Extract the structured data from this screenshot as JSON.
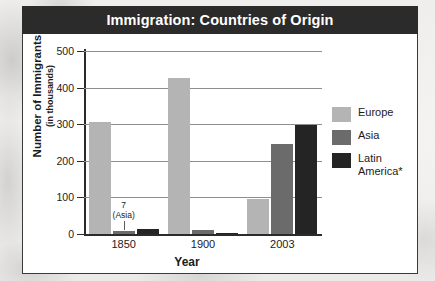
{
  "chart_data": {
    "type": "bar",
    "title": "Immigration: Countries of Origin",
    "xlabel": "Year",
    "ylabel": "Number of Immigrants",
    "ylabel_sub": "(in thousands)",
    "categories": [
      "1850",
      "1900",
      "2003"
    ],
    "ylim": [
      0,
      500
    ],
    "yticks": [
      0,
      100,
      200,
      300,
      400,
      500
    ],
    "ytick_labels": [
      "0",
      "100",
      "200",
      "300",
      "400",
      "500"
    ],
    "grid": true,
    "legend_position": "right",
    "series": [
      {
        "name": "Europe",
        "color": "#b4b4b4",
        "values": [
          305,
          425,
          96
        ]
      },
      {
        "name": "Asia",
        "color": "#6b6b6b",
        "values": [
          7,
          12,
          246
        ]
      },
      {
        "name": "Latin America*",
        "color": "#242424",
        "values": [
          15,
          4,
          298
        ]
      }
    ],
    "annotations": [
      {
        "text_line1": "7",
        "text_line2": "(Asia)",
        "series": "Asia",
        "category": "1850",
        "value": 7
      }
    ]
  },
  "legend": {
    "entries": [
      {
        "label": "Europe"
      },
      {
        "label": "Asia"
      },
      {
        "label": "Latin",
        "label2": "America*"
      }
    ]
  }
}
